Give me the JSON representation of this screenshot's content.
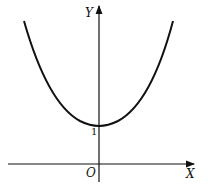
{
  "diagram": {
    "type": "function-graph",
    "axes": {
      "x_label": "X",
      "y_label": "Y",
      "origin_label": "O"
    },
    "annotations": {
      "y_intercept_label": "1"
    },
    "curve": {
      "shape": "convex, symmetric about Y axis",
      "minimum": [
        0,
        1
      ]
    },
    "colors": {
      "stroke": "#111111",
      "background": "#ffffff"
    }
  }
}
